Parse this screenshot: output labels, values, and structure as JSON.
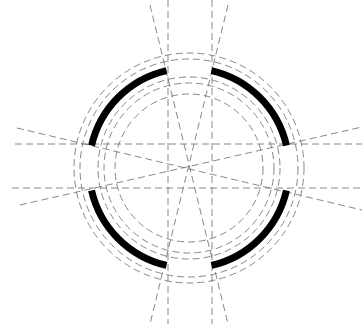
{
  "diagram": {
    "type": "technical-drawing",
    "colors": {
      "background": "#ffffff",
      "construction_line": "#7a7a7a",
      "solid_arc": "#000000"
    },
    "center": [
      189,
      168
    ],
    "construction_circles_radii": [
      74,
      85,
      91,
      109,
      115
    ],
    "thick_arc_radius": 100,
    "thick_arcs": [
      {
        "name": "upper-left",
        "start_deg": 193,
        "end_deg": 257
      },
      {
        "name": "upper-right",
        "start_deg": 283,
        "end_deg": 347
      },
      {
        "name": "lower-right",
        "start_deg": 13,
        "end_deg": 77
      },
      {
        "name": "lower-left",
        "start_deg": 103,
        "end_deg": 167
      }
    ],
    "construction_lines": [
      {
        "name": "vertical-left",
        "x1": 168,
        "y1": 0,
        "x2": 168,
        "y2": 324
      },
      {
        "name": "vertical-right",
        "x1": 212,
        "y1": 0,
        "x2": 212,
        "y2": 324
      },
      {
        "name": "horizontal-top",
        "x1": 15,
        "y1": 144,
        "x2": 362,
        "y2": 144
      },
      {
        "name": "horizontal-bottom",
        "x1": 12,
        "y1": 188,
        "x2": 362,
        "y2": 188
      },
      {
        "name": "diagonal-steep-a",
        "x1": 150,
        "y1": 5,
        "x2": 228,
        "y2": 324
      },
      {
        "name": "diagonal-steep-b",
        "x1": 228,
        "y1": 5,
        "x2": 150,
        "y2": 324
      },
      {
        "name": "diagonal-shallow-a",
        "x1": 17,
        "y1": 128,
        "x2": 362,
        "y2": 210
      },
      {
        "name": "diagonal-shallow-b",
        "x1": 20,
        "y1": 205,
        "x2": 362,
        "y2": 127
      }
    ]
  }
}
